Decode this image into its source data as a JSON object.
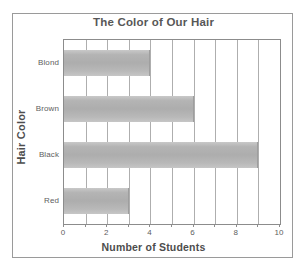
{
  "chart_data": {
    "type": "bar",
    "orientation": "horizontal",
    "title": "The Color of Our Hair",
    "xlabel": "Number of Students",
    "ylabel": "Hair Color",
    "categories": [
      "Blond",
      "Brown",
      "Black",
      "Red"
    ],
    "values": [
      4,
      6,
      9,
      3
    ],
    "xlim": [
      0,
      10
    ],
    "x_ticks": [
      0,
      1,
      2,
      3,
      4,
      5,
      6,
      7,
      8,
      9,
      10
    ],
    "x_tick_labels": [
      "0",
      "",
      "2",
      "",
      "4",
      "",
      "6",
      "",
      "8",
      "",
      "10"
    ],
    "grid": true,
    "grid_axis": "x",
    "legend": false,
    "bar_color": "#b4b4b4",
    "frame_color": "#8c8c8c",
    "text_color": "#5e5e5e"
  }
}
